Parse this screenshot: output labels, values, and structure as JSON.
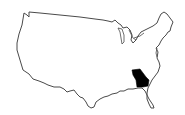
{
  "map": {
    "region": "United States (contiguous)",
    "highlighted_state": "Georgia",
    "outline_color": "#4a4a4a",
    "fill_color": "#ffffff",
    "highlight_color": "#000000"
  }
}
